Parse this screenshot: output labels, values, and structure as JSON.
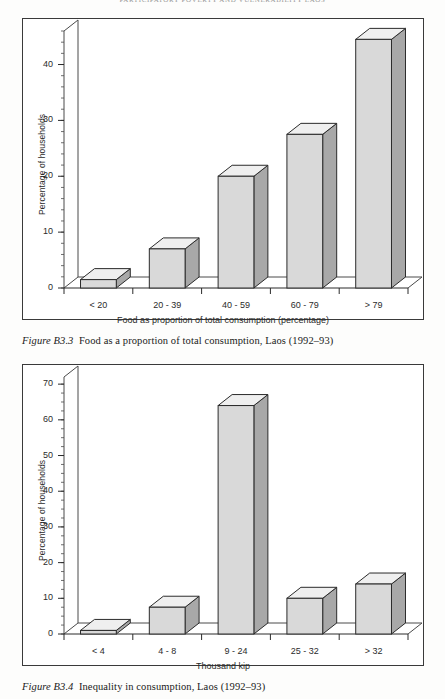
{
  "page": {
    "running_head": "PARTICIPATORY POVERTY AND VULNERABILITY LAOS"
  },
  "figures": [
    {
      "id": "figure-b3-3",
      "caption_label": "Figure B3.3",
      "caption_text": "Food as a proportion of total consumption, Laos (1992–93)"
    },
    {
      "id": "figure-b3-4",
      "caption_label": "Figure B3.4",
      "caption_text": "Inequality in consumption, Laos (1992–93)"
    }
  ],
  "chart_data": [
    {
      "type": "bar",
      "title": "",
      "categories": [
        "< 20",
        "20 - 39",
        "40 - 59",
        "60 - 79",
        "> 79"
      ],
      "values": [
        1.5,
        7,
        20,
        27.5,
        44.5
      ],
      "xlabel": "Food as proportion of total consumption (percentage)",
      "ylabel": "Percentage of households",
      "ylim": [
        0,
        46
      ],
      "yticks": [
        0,
        10,
        20,
        30,
        40
      ],
      "ytick_labels": [
        "0",
        "10",
        "20",
        "30",
        "40"
      ],
      "minor_tick_step": 2,
      "grid": false,
      "legend": "none",
      "style": "3d-bar",
      "bar_face_color": "#d9d9d9",
      "bar_side_color": "#a8a8a8",
      "bar_top_color": "#efefef",
      "bar_edge_color": "#2b2b2b"
    },
    {
      "type": "bar",
      "title": "",
      "categories": [
        "< 4",
        "4 - 8",
        "9 - 24",
        "25 - 32",
        "> 32"
      ],
      "values": [
        1,
        7.5,
        64,
        10,
        14
      ],
      "xlabel": "Thousand kip",
      "ylabel": "Percentage of households",
      "ylim": [
        0,
        72
      ],
      "yticks": [
        0,
        10,
        20,
        30,
        40,
        50,
        60,
        70
      ],
      "ytick_labels": [
        "0",
        "10",
        "20",
        "30",
        "40",
        "50",
        "60",
        "70"
      ],
      "minor_tick_step": 2.5,
      "grid": false,
      "legend": "none",
      "style": "3d-bar",
      "bar_face_color": "#d9d9d9",
      "bar_side_color": "#a8a8a8",
      "bar_top_color": "#efefef",
      "bar_edge_color": "#2b2b2b"
    }
  ]
}
